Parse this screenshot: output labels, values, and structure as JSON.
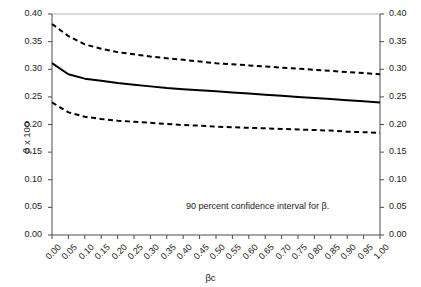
{
  "chart_data": {
    "type": "line",
    "title": "",
    "xlabel": "βc",
    "ylabel": "β x 100",
    "xlim": [
      0.0,
      1.0
    ],
    "ylim": [
      0.0,
      0.4
    ],
    "grid": false,
    "legend_position": "none",
    "annotation": "90 percent confidence interval for β.",
    "dual_y_axis": true,
    "x_tick_labels": [
      "0.00",
      "0.05",
      "0.10",
      "0.15",
      "0.20",
      "0.25",
      "0.30",
      "0.35",
      "0.40",
      "0.45",
      "0.50",
      "0.55",
      "0.60",
      "0.65",
      "0.70",
      "0.75",
      "0.80",
      "0.85",
      "0.90",
      "0.95",
      "1.00"
    ],
    "y_tick_labels": [
      "0.00",
      "0.05",
      "0.10",
      "0.15",
      "0.20",
      "0.25",
      "0.30",
      "0.35",
      "0.40"
    ],
    "y_tick_labels_right": [
      "0.00",
      "0.05",
      "0.10",
      "0.15",
      "0.20",
      "0.25",
      "0.30",
      "0.35",
      "0.40"
    ],
    "x": [
      0.0,
      0.05,
      0.1,
      0.15,
      0.2,
      0.25,
      0.3,
      0.35,
      0.4,
      0.45,
      0.5,
      0.55,
      0.6,
      0.65,
      0.7,
      0.75,
      0.8,
      0.85,
      0.9,
      0.95,
      1.0
    ],
    "series": [
      {
        "name": "upper 90% confidence bound",
        "style": "dashed",
        "color": "#000000",
        "values": [
          0.382,
          0.36,
          0.345,
          0.337,
          0.331,
          0.327,
          0.323,
          0.32,
          0.317,
          0.314,
          0.311,
          0.309,
          0.307,
          0.305,
          0.303,
          0.301,
          0.299,
          0.297,
          0.295,
          0.293,
          0.291
        ]
      },
      {
        "name": "point estimate",
        "style": "solid",
        "color": "#000000",
        "values": [
          0.311,
          0.291,
          0.283,
          0.279,
          0.275,
          0.272,
          0.269,
          0.266,
          0.264,
          0.262,
          0.26,
          0.258,
          0.256,
          0.254,
          0.252,
          0.25,
          0.248,
          0.246,
          0.244,
          0.242,
          0.24
        ]
      },
      {
        "name": "lower 90% confidence bound",
        "style": "dashed",
        "color": "#000000",
        "values": [
          0.24,
          0.222,
          0.214,
          0.21,
          0.207,
          0.205,
          0.203,
          0.201,
          0.199,
          0.198,
          0.196,
          0.195,
          0.194,
          0.193,
          0.192,
          0.191,
          0.19,
          0.189,
          0.187,
          0.186,
          0.185
        ]
      }
    ],
    "colors": {
      "line": "#000000",
      "axis": "#4d4d4d",
      "gridline_top": "#b3b3b3",
      "text": "#1a1a1a",
      "background": "#ffffff"
    }
  }
}
